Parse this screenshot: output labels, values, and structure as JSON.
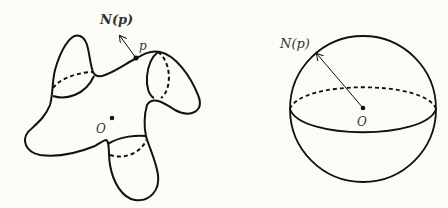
{
  "left_figure": {
    "name": "closed surface",
    "normal_label": "N(p)",
    "normal_label_bold": true,
    "point_label": "p",
    "center_label": "O"
  },
  "right_figure": {
    "name": "unit sphere",
    "normal_label": "N(p)",
    "center_label": "O"
  },
  "colors": {
    "background": "#fbfbf7",
    "stroke": "#111111",
    "text": "#333333"
  }
}
